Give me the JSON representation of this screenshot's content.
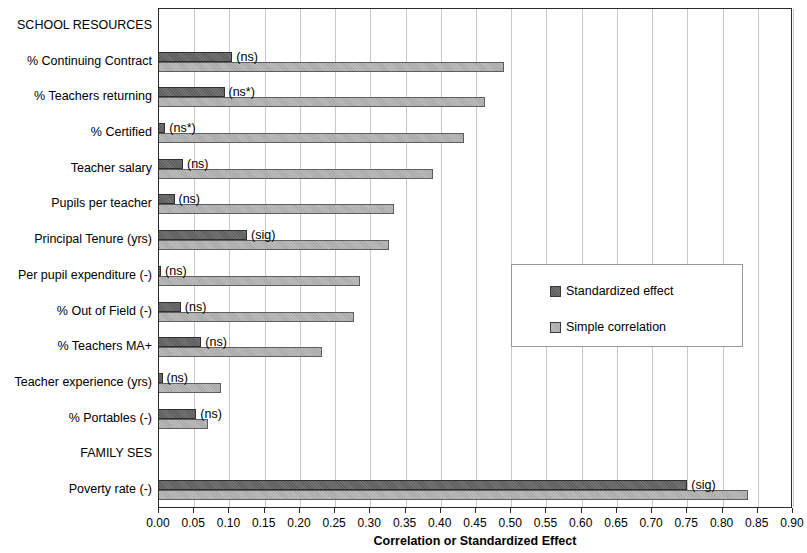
{
  "chart_data": {
    "type": "bar",
    "orientation": "horizontal",
    "title": "",
    "xlabel": "Correlation or Standardized Effect",
    "ylabel": "",
    "xlim": [
      0.0,
      0.9
    ],
    "xticks": [
      "0.00",
      "0.05",
      "0.10",
      "0.15",
      "0.20",
      "0.25",
      "0.30",
      "0.35",
      "0.40",
      "0.45",
      "0.50",
      "0.55",
      "0.60",
      "0.65",
      "0.70",
      "0.75",
      "0.80",
      "0.85",
      "0.90"
    ],
    "xtick_values": [
      0.0,
      0.05,
      0.1,
      0.15,
      0.2,
      0.25,
      0.3,
      0.35,
      0.4,
      0.45,
      0.5,
      0.55,
      0.6,
      0.65,
      0.7,
      0.75,
      0.8,
      0.85,
      0.9
    ],
    "grid": "vertical",
    "legend_position": "middle-right-inset",
    "series": [
      {
        "name": "Standardized effect",
        "color": "#737373"
      },
      {
        "name": "Simple correlation",
        "color": "#a9a9a9"
      }
    ],
    "categories": [
      "SCHOOL RESOURCES",
      "% Continuing Contract",
      "% Teachers returning",
      "% Certified",
      "Teacher salary",
      "Pupils per teacher",
      "Principal Tenure (yrs)",
      "Per pupil expenditure (-)",
      "% Out of Field (-)",
      "% Teachers MA+",
      "Teacher experience (yrs)",
      "% Portables (-)",
      "FAMILY SES",
      "Poverty rate (-)"
    ],
    "rows": [
      {
        "label": "SCHOOL RESOURCES",
        "is_header": true,
        "standardized_effect": null,
        "simple_correlation": null,
        "note": ""
      },
      {
        "label": "% Continuing Contract",
        "is_header": false,
        "standardized_effect": 0.104,
        "simple_correlation": 0.49,
        "note": "(ns)"
      },
      {
        "label": "% Teachers returning",
        "is_header": false,
        "standardized_effect": 0.093,
        "simple_correlation": 0.462,
        "note": "(ns*)"
      },
      {
        "label": "% Certified",
        "is_header": false,
        "standardized_effect": 0.009,
        "simple_correlation": 0.433,
        "note": "(ns*)"
      },
      {
        "label": "Teacher salary",
        "is_header": false,
        "standardized_effect": 0.034,
        "simple_correlation": 0.389,
        "note": "(ns)"
      },
      {
        "label": "Pupils per teacher",
        "is_header": false,
        "standardized_effect": 0.022,
        "simple_correlation": 0.334,
        "note": "(ns)"
      },
      {
        "label": "Principal Tenure (yrs)",
        "is_header": false,
        "standardized_effect": 0.125,
        "simple_correlation": 0.327,
        "note": "(sig)"
      },
      {
        "label": "Per pupil expenditure (-)",
        "is_header": false,
        "standardized_effect": 0.003,
        "simple_correlation": 0.285,
        "note": "(ns)"
      },
      {
        "label": "% Out of Field (-)",
        "is_header": false,
        "standardized_effect": 0.031,
        "simple_correlation": 0.277,
        "note": "(ns)"
      },
      {
        "label": "% Teachers MA+",
        "is_header": false,
        "standardized_effect": 0.06,
        "simple_correlation": 0.231,
        "note": "(ns)"
      },
      {
        "label": "Teacher experience (yrs)",
        "is_header": false,
        "standardized_effect": 0.005,
        "simple_correlation": 0.088,
        "note": "(ns)"
      },
      {
        "label": "% Portables (-)",
        "is_header": false,
        "standardized_effect": 0.053,
        "simple_correlation": 0.069,
        "note": "(ns)"
      },
      {
        "label": "FAMILY SES",
        "is_header": true,
        "standardized_effect": null,
        "simple_correlation": null,
        "note": ""
      },
      {
        "label": "Poverty rate (-)",
        "is_header": false,
        "standardized_effect": 0.75,
        "simple_correlation": 0.836,
        "note": "(sig)"
      }
    ]
  },
  "legend": {
    "items": [
      {
        "label": "Standardized effect",
        "swatch": "dark"
      },
      {
        "label": "Simple correlation",
        "swatch": "light"
      }
    ]
  },
  "axis": {
    "x_title": "Correlation or Standardized Effect"
  }
}
